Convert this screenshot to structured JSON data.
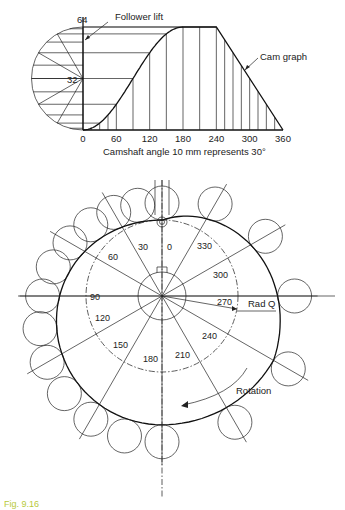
{
  "cam_graph": {
    "y_labels": {
      "top": "64",
      "mid": "32"
    },
    "x_ticks": [
      "0",
      "60",
      "120",
      "180",
      "240",
      "300",
      "360"
    ],
    "x_axis_label": "Camshaft angle 10 mm represents 30°",
    "annotations": {
      "follower_lift": "Follower lift",
      "cam_graph": "Cam graph"
    }
  },
  "cam_profile": {
    "angle_labels": [
      "0",
      "30",
      "60",
      "90",
      "120",
      "150",
      "180",
      "210",
      "240",
      "270",
      "300",
      "330"
    ],
    "annotations": {
      "rad_q": "Rad Q",
      "rotation": "Rotation"
    }
  },
  "caption": "Fig. 9.16",
  "chart_data": {
    "type": "line",
    "title": "Cam graph",
    "xlabel": "Camshaft angle 10 mm represents 30°",
    "ylabel": "Follower lift",
    "x": [
      0,
      30,
      60,
      90,
      120,
      150,
      180,
      210,
      240,
      270,
      300,
      330,
      360
    ],
    "y": [
      0,
      4.3,
      16,
      32,
      48,
      59.7,
      64,
      64,
      64,
      48,
      32,
      16,
      0
    ],
    "xlim": [
      0,
      360
    ],
    "ylim": [
      0,
      64
    ],
    "x_tick_labels": [
      "0",
      "60",
      "120",
      "180",
      "240",
      "300",
      "360"
    ],
    "y_tick_labels": [
      "32",
      "64"
    ],
    "segments": [
      {
        "range": [
          0,
          180
        ],
        "motion": "simple harmonic rise"
      },
      {
        "range": [
          180,
          240
        ],
        "motion": "dwell"
      },
      {
        "range": [
          240,
          360
        ],
        "motion": "uniform velocity fall"
      }
    ]
  }
}
